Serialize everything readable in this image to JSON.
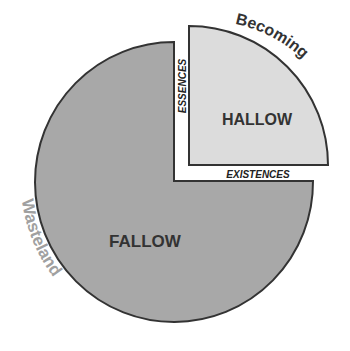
{
  "diagram": {
    "labels": {
      "large_region": "FALLOW",
      "small_region": "HALLOW",
      "vertical_edge": "ESSENCES",
      "horizontal_edge": "EXISTENCES",
      "small_arc": "Becoming",
      "large_arc": "Wasteland"
    },
    "colors": {
      "large_fill": "#a8a8a8",
      "small_fill": "#dcdcdc",
      "outline": "#333333",
      "arc_text_dark": "#333333",
      "arc_text_light": "#a0a0a0"
    }
  }
}
